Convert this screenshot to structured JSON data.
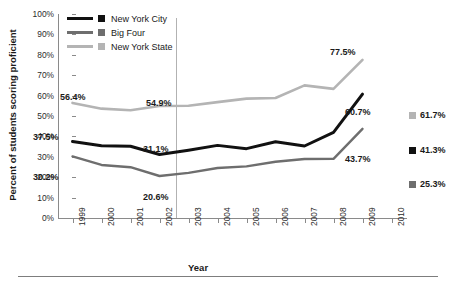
{
  "top_remnant": "",
  "chart_data": {
    "type": "line",
    "title": "",
    "xlabel": "Year",
    "ylabel": "Percent of students scoring proficient",
    "x": [
      1999,
      2000,
      2001,
      2002,
      2003,
      2004,
      2005,
      2006,
      2007,
      2008,
      2009
    ],
    "xlim": [
      1999,
      2010
    ],
    "ylim": [
      0,
      100
    ],
    "grid": false,
    "legend_position": "top-left",
    "ytick_labels": [
      "100%",
      "90%",
      "80%",
      "70%",
      "60%",
      "50%",
      "40%",
      "30%",
      "20%",
      "10%",
      "0%"
    ],
    "ytick_values": [
      100,
      90,
      80,
      70,
      60,
      50,
      40,
      30,
      20,
      10,
      0
    ],
    "xtick_labels": [
      "1999",
      "2000",
      "2001",
      "2002",
      "2003",
      "2004",
      "2005",
      "2006",
      "2007",
      "2008",
      "2009",
      "2010"
    ],
    "series": [
      {
        "name": "New York City",
        "color": "#111111",
        "values": [
          37.5,
          35.4,
          35.2,
          31.1,
          33.2,
          35.6,
          34.0,
          37.4,
          35.3,
          42.0,
          60.7
        ]
      },
      {
        "name": "Big Four",
        "color": "#6e6e6e",
        "values": [
          30.2,
          26.0,
          24.9,
          20.6,
          22.1,
          24.5,
          25.3,
          27.6,
          28.9,
          29.0,
          43.7
        ]
      },
      {
        "name": "New York State",
        "color": "#b4b4b4",
        "values": [
          56.4,
          53.6,
          52.8,
          54.9,
          55.0,
          56.8,
          58.5,
          58.8,
          65.0,
          63.3,
          77.5
        ]
      }
    ],
    "annotations": [
      {
        "text": "56.4%",
        "series": "New York State",
        "year": 1999
      },
      {
        "text": "54.9%",
        "series": "New York State",
        "year": 2002
      },
      {
        "text": "77.5%",
        "series": "New York State",
        "year": 2009
      },
      {
        "text": "37.5%",
        "series": "New York City",
        "year": 1999
      },
      {
        "text": "31.1%",
        "series": "New York City",
        "year": 2002
      },
      {
        "text": "60.7%",
        "series": "New York City",
        "year": 2009
      },
      {
        "text": "30.2%",
        "series": "Big Four",
        "year": 1999
      },
      {
        "text": "20.6%",
        "series": "Big Four",
        "year": 2002
      },
      {
        "text": "43.7%",
        "series": "Big Four",
        "year": 2009
      }
    ],
    "targets": [
      {
        "label": "61.7%",
        "series": "New York State",
        "color": "#b4b4b4",
        "year": 2010
      },
      {
        "label": "41.3%",
        "series": "New York City",
        "color": "#111111",
        "year": 2010
      },
      {
        "label": "25.3%",
        "series": "Big Four",
        "color": "#6e6e6e",
        "year": 2010
      }
    ]
  },
  "legend": {
    "items": [
      {
        "label": "New York City",
        "color": "#111111"
      },
      {
        "label": "Big Four",
        "color": "#6e6e6e"
      },
      {
        "label": "New York State",
        "color": "#b4b4b4"
      }
    ]
  },
  "annotation_labels": {
    "nys_1999": "56.4%",
    "nys_2002": "54.9%",
    "nys_2009": "77.5%",
    "nyc_1999": "37.5%",
    "nyc_2002": "31.1%",
    "nyc_2009": "60.7%",
    "big4_1999": "30.2%",
    "big4_2002": "20.6%",
    "big4_2009": "43.7%"
  },
  "targets": {
    "nys": "61.7%",
    "nyc": "41.3%",
    "big4": "25.3%"
  }
}
